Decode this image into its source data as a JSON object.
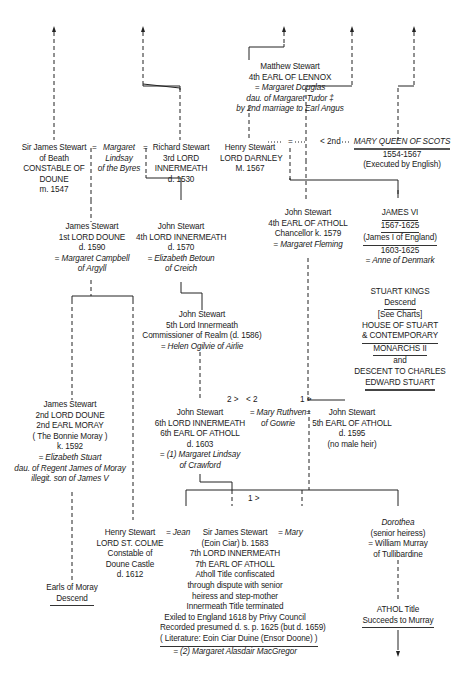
{
  "chart": {
    "markers": {
      "marriage": "=",
      "second_marriage": "< 2nd",
      "first_order": "1 >",
      "second_order_left": "2 >",
      "second_order_right": "< 2"
    },
    "nodes": {
      "lennox": {
        "name": "Matthew Stewart",
        "title": "4th EARL OF LENNOX",
        "spouse": "= Margaret Douglas",
        "spouse_note1": "dau. of Margaret Tudor ‡",
        "spouse_note2": "by 2nd marriage to Earl Angus"
      },
      "james_beath": {
        "name": "Sir James Stewart",
        "line2": "of Beath",
        "line3": "CONSTABLE OF",
        "line4": "DOUNE",
        "line5": "m. 1547"
      },
      "margaret_lindsay_byres": {
        "line1": "Margaret",
        "line2": "Lindsay",
        "line3": "of the Byres"
      },
      "richard": {
        "name": "Richard Stewart",
        "line2": "3rd LORD",
        "line3": "INNERMEATH",
        "line4": "d. 1530"
      },
      "darnley": {
        "name": "Henry Stewart",
        "line2": "LORD DARNLEY",
        "line3": "M. 1567"
      },
      "mary_qos": {
        "name": "MARY QUEEN OF SCOTS",
        "line2": "1554-1567",
        "line3": "(Executed by English)"
      },
      "james_doune1": {
        "name": "James Stewart",
        "line2": "1st LORD DOUNE",
        "line3": "d. 1590",
        "spouse": "= Margaret Campbell",
        "spouse2": "of Argyll"
      },
      "john_4th_inn": {
        "name": "John Stewart",
        "line2": "4th LORD INNERMEATH",
        "line3": "d. 1570",
        "spouse": "= Elizabeth Betoun",
        "spouse2": "of Creich"
      },
      "john_4th_atholl": {
        "name": "John Stewart",
        "line2": "4th EARL OF ATHOLL",
        "line3": "Chancellor  k. 1579",
        "spouse": "= Margaret Fleming"
      },
      "james_vi": {
        "name": "JAMES VI",
        "line2": "1567-1625",
        "line3": "(James I of England)",
        "line4": "1603-1625",
        "spouse": "= Anne of Denmark"
      },
      "stuart_kings": {
        "line1": "STUART KINGS",
        "line2": "Descend"
      },
      "see_charts": {
        "line1": "[See Charts]",
        "line2": "HOUSE OF STUART",
        "line3": "& CONTEMPORARY",
        "line4": "MONARCHS II",
        "line5": "and",
        "line6": "DESCENT TO CHARLES",
        "line7": "EDWARD STUART"
      },
      "john_5th_inn": {
        "name": "John Stewart",
        "line2": "5th Lord Innermeath",
        "line3": "Commissioner of Realm (d. 1586)",
        "spouse": "= Helen Ogilvie of Airlie"
      },
      "james_doune2": {
        "name": "James Stewart",
        "line2": "2nd LORD DOUNE",
        "line3": "2nd EARL MORAY",
        "line4": "( The Bonnie Moray )",
        "line5": "k. 1592",
        "spouse": "= Elizabeth Stuart",
        "spouse2": "dau. of Regent James of Moray",
        "spouse3": "illegit. son of James V"
      },
      "john_6th": {
        "name": "John Stewart",
        "line2": "6th LORD INNERMEATH",
        "line3": "6th EARL OF ATHOLL",
        "line4": "d. 1603",
        "spouse": "= (1) Margaret Lindsay",
        "spouse2": "of Crawford"
      },
      "mary_ruthven": {
        "line1": "= Mary Ruthven",
        "line2": "of Gowrie"
      },
      "john_5th_atholl": {
        "name": "John Stewart",
        "line2": "5th EARL OF ATHOLL",
        "line3": "d. 1595",
        "line4": "(no male heir)"
      },
      "henry_st_colme": {
        "name": "Henry Stewart",
        "line2": "LORD ST. COLME",
        "line3": "Constable of",
        "line4": "Doune Castle",
        "line5": "d. 1612"
      },
      "jean": {
        "line1": "= Jean"
      },
      "james_7th": {
        "name": "Sir James Stewart",
        "line2": "(Eoin Ciar) b. 1583",
        "line3": "7th LORD INNERMEATH",
        "line4": "7th EARL OF ATHOLL",
        "line5": "Atholl Title confiscated",
        "line6": "through dispute with senior",
        "line7": "heiress and step-mother",
        "line8": "Innermeath Title terminated",
        "line9": "Exiled to England 1618 by Privy Council",
        "line10": "Recorded presumed d. s. p. 1625 (but d. 1659)",
        "line11": "( Literature: Eoin Ciar Duine (Ensor Doone) )",
        "spouse": "= (2) Margaret Alasdair MacGregor"
      },
      "mary": {
        "line1": "= Mary"
      },
      "dorothea": {
        "name": "Dorothea",
        "line2": "(senior heiress)",
        "line3": "= William Murray",
        "line4": "of Tullibardine"
      },
      "earls_moray": {
        "line1": "Earls of Moray",
        "line2": "Descend"
      },
      "athol_title": {
        "line1": "ATHOL Title",
        "line2": "Succeeds to Murray"
      }
    }
  }
}
